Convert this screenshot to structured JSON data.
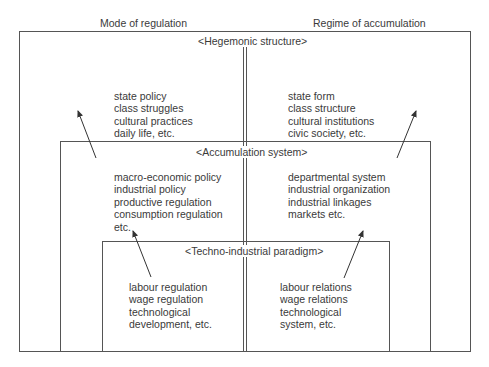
{
  "headers": {
    "left": "Mode of regulation",
    "right": "Regime of accumulation"
  },
  "levels": [
    {
      "label": "<Hegemonic structure>",
      "left_items": [
        "state policy",
        "class struggles",
        "cultural practices",
        "daily life, etc."
      ],
      "right_items": [
        "state form",
        "class structure",
        "cultural institutions",
        "civic society, etc."
      ]
    },
    {
      "label": "<Accumulation system>",
      "left_items": [
        "macro-economic policy",
        "industrial policy",
        "productive regulation",
        "consumption regulation",
        "etc."
      ],
      "right_items": [
        "departmental system",
        "industrial organization",
        "industrial linkages",
        "markets etc."
      ]
    },
    {
      "label": "<Techno-industrial paradigm>",
      "left_items": [
        "labour regulation",
        "wage regulation",
        "technological",
        "development, etc."
      ],
      "right_items": [
        "labour relations",
        "wage relations",
        "technological",
        "system, etc."
      ]
    }
  ],
  "colors": {
    "line": "#555555",
    "text": "#3a3a3a",
    "background": "#ffffff"
  }
}
